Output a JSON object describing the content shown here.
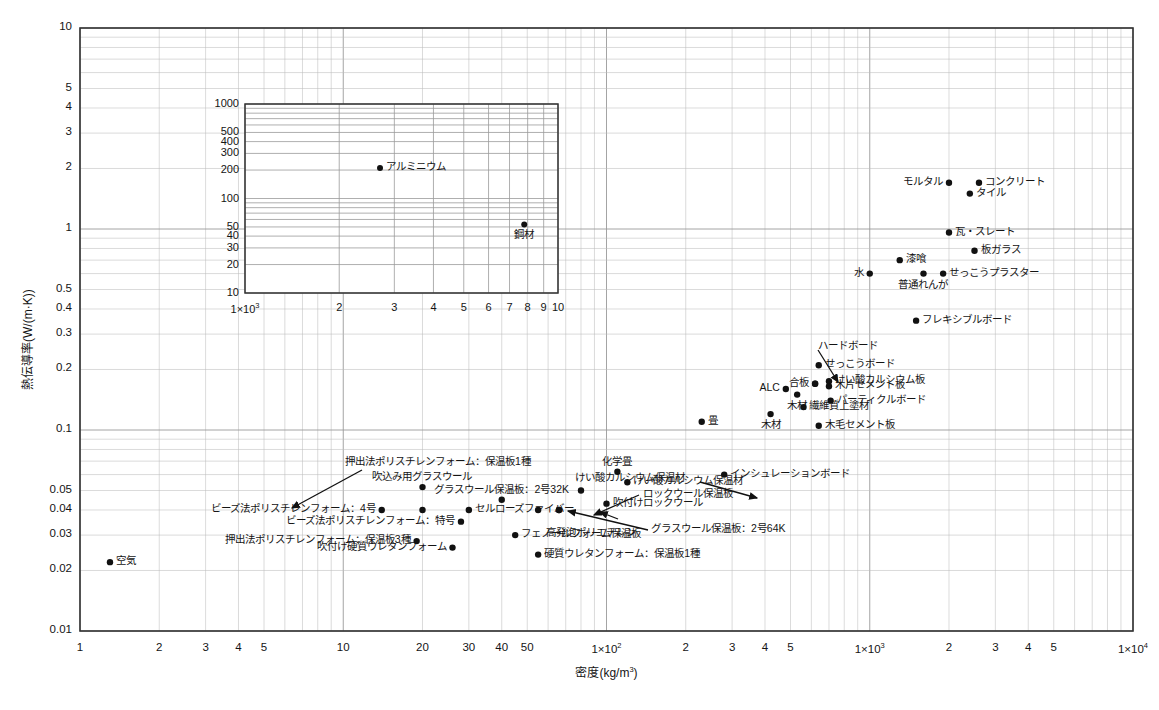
{
  "chart_data": {
    "type": "scatter",
    "title": "",
    "xlabel": "密度(kg/m³)",
    "ylabel": "熱伝導率(W/(m·K))",
    "xscale": "log",
    "yscale": "log",
    "xlim": [
      1,
      10000
    ],
    "ylim": [
      0.01,
      10
    ],
    "grid": true,
    "legend": "none",
    "xticks": [
      "1",
      "2",
      "3",
      "4",
      "5",
      "10",
      "20",
      "30",
      "40",
      "50",
      "1×10²",
      "2",
      "3",
      "4",
      "5",
      "1×10³",
      "2",
      "3",
      "4",
      "5",
      "1×10⁴"
    ],
    "yticks": [
      "0.01",
      "0.02",
      "0.03",
      "0.04",
      "0.05",
      "0.1",
      "0.2",
      "0.3",
      "0.4",
      "0.5",
      "1",
      "2",
      "3",
      "4",
      "5",
      "10"
    ],
    "points": [
      {
        "label": "空気",
        "x": 1.3,
        "y": 0.022,
        "lp": "right"
      },
      {
        "label": "押出法ポリスチレンフォーム：保温板3種",
        "x": 19,
        "y": 0.028,
        "lp": "left"
      },
      {
        "label": "吹付け硬質ウレタンフォーム",
        "x": 26,
        "y": 0.026,
        "lp": "left"
      },
      {
        "label": "ビーズ法ポリスチレンフォーム：4号",
        "x": 14,
        "y": 0.04,
        "lp": "left"
      },
      {
        "label": "ビーズ法ポリスチレンフォーム：特号",
        "x": 28,
        "y": 0.035,
        "lp": "left"
      },
      {
        "label": "押出法ポリスチレンフォーム：保温板1種",
        "x": 20,
        "y": 0.04,
        "lp": "arrow"
      },
      {
        "label": "吹込み用グラスウール",
        "x": 20,
        "y": 0.052,
        "lp": "above"
      },
      {
        "label": "セルローズファイバー",
        "x": 30,
        "y": 0.04,
        "lp": "right"
      },
      {
        "label": "グラスウール保温板：2号32K",
        "x": 40,
        "y": 0.045,
        "lp": "above"
      },
      {
        "label": "フェノールフォーム保温板",
        "x": 45,
        "y": 0.03,
        "lp": "right"
      },
      {
        "label": "高発泡ポリエチレン",
        "x": 55,
        "y": 0.04,
        "lp": "arrow"
      },
      {
        "label": "硬質ウレタンフォーム：保温板1種",
        "x": 55,
        "y": 0.024,
        "lp": "right"
      },
      {
        "label": "グラスウール保温板：2号64K",
        "x": 66,
        "y": 0.04,
        "lp": "arrow"
      },
      {
        "label": "けい酸カルシウム保温材",
        "x": 80,
        "y": 0.05,
        "lp": "arrow"
      },
      {
        "label": "吹付けロックウール",
        "x": 100,
        "y": 0.043,
        "lp": "right"
      },
      {
        "label": "ロックウール保温板",
        "x": 66,
        "y": 0.04,
        "lp": "arrow"
      },
      {
        "label": "けい酸カルシウム保温材",
        "x": 120,
        "y": 0.055,
        "lp": "right"
      },
      {
        "label": "化学畳",
        "x": 110,
        "y": 0.062,
        "lp": "above"
      },
      {
        "label": "インシュレーションボード",
        "x": 280,
        "y": 0.06,
        "lp": "right"
      },
      {
        "label": "畳",
        "x": 230,
        "y": 0.11,
        "lp": "right"
      },
      {
        "label": "木材",
        "x": 420,
        "y": 0.12,
        "lp": "below"
      },
      {
        "label": "木材",
        "x": 530,
        "y": 0.15,
        "lp": "below"
      },
      {
        "label": "ALC",
        "x": 480,
        "y": 0.16,
        "lp": "left"
      },
      {
        "label": "繊維質上塗材",
        "x": 560,
        "y": 0.13,
        "lp": "right"
      },
      {
        "label": "木毛セメント板",
        "x": 640,
        "y": 0.105,
        "lp": "right"
      },
      {
        "label": "合板",
        "x": 620,
        "y": 0.17,
        "lp": "left"
      },
      {
        "label": "ハードボード",
        "x": 620,
        "y": 0.17,
        "lp": "arrow"
      },
      {
        "label": "せっこうボード",
        "x": 640,
        "y": 0.21,
        "lp": "right"
      },
      {
        "label": "けい酸カルシウム板",
        "x": 700,
        "y": 0.175,
        "lp": "right"
      },
      {
        "label": "木片セメント板",
        "x": 700,
        "y": 0.165,
        "lp": "right"
      },
      {
        "label": "パーティクルボード",
        "x": 710,
        "y": 0.14,
        "lp": "right"
      },
      {
        "label": "フレキシブルボード",
        "x": 1500,
        "y": 0.35,
        "lp": "right"
      },
      {
        "label": "水",
        "x": 1000,
        "y": 0.6,
        "lp": "left"
      },
      {
        "label": "漆喰",
        "x": 1300,
        "y": 0.7,
        "lp": "right"
      },
      {
        "label": "普通れんが",
        "x": 1600,
        "y": 0.6,
        "lp": "below"
      },
      {
        "label": "せっこうプラスター",
        "x": 1900,
        "y": 0.6,
        "lp": "right"
      },
      {
        "label": "板ガラス",
        "x": 2500,
        "y": 0.78,
        "lp": "right"
      },
      {
        "label": "瓦・スレート",
        "x": 2000,
        "y": 0.96,
        "lp": "right"
      },
      {
        "label": "タイル",
        "x": 2400,
        "y": 1.5,
        "lp": "right"
      },
      {
        "label": "モルタル",
        "x": 2000,
        "y": 1.7,
        "lp": "left"
      },
      {
        "label": "コンクリート",
        "x": 2600,
        "y": 1.7,
        "lp": "right"
      }
    ],
    "inset": {
      "xlabel": "",
      "ylabel": "",
      "xscale": "log",
      "yscale": "log",
      "xlim": [
        1000,
        10000
      ],
      "ylim": [
        10,
        1000
      ],
      "xticks": [
        "1×10³",
        "2",
        "3",
        "4",
        "5",
        "6",
        "7",
        "8",
        "9",
        "10"
      ],
      "yticks": [
        "10",
        "20",
        "30",
        "40",
        "50",
        "100",
        "200",
        "300",
        "400",
        "500",
        "1000"
      ],
      "points": [
        {
          "label": "アルミニウム",
          "x": 2700,
          "y": 210,
          "lp": "right"
        },
        {
          "label": "鋼材",
          "x": 7800,
          "y": 53,
          "lp": "below"
        }
      ]
    }
  },
  "colors": {
    "frame": "#333333",
    "grid_major": "#9a9a9a",
    "grid_minor": "#bdbdbd",
    "point": "#111111",
    "text": "#141414"
  }
}
